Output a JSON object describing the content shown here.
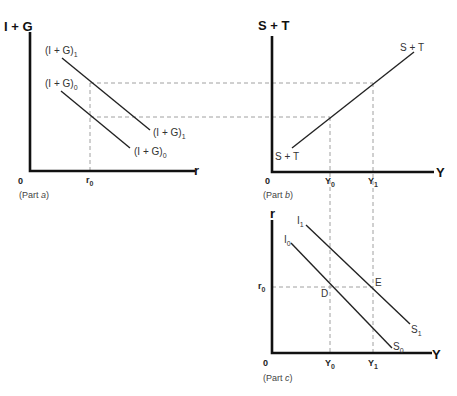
{
  "panels": {
    "a": {
      "y_axis_title": "I + G",
      "x_axis_title": "r",
      "origin": "0",
      "tick_r0": "r",
      "tick_r0_sub": "0",
      "caption_prefix": "(Part ",
      "caption_letter": "a",
      "caption_suffix": ")",
      "curve1_label_top": "(I + G)",
      "curve1_label_top_sub": "1",
      "curve1_label_bottom": "(I + G)",
      "curve1_label_bottom_sub": "1",
      "curve0_label_top": "(I + G)",
      "curve0_label_top_sub": "0",
      "curve0_label_bottom": "(I + G)",
      "curve0_label_bottom_sub": "0"
    },
    "b": {
      "y_axis_title": "S + T",
      "x_axis_title": "Y",
      "origin": "0",
      "tick_y0": "Y",
      "tick_y0_sub": "0",
      "tick_y1": "Y",
      "tick_y1_sub": "1",
      "caption_prefix": "(Part ",
      "caption_letter": "b",
      "caption_suffix": ")",
      "curve_label_top": "S + T",
      "curve_label_bottom": "S + T"
    },
    "c": {
      "y_axis_title": "r",
      "x_axis_title": "Y",
      "origin": "0",
      "tick_r0": "r",
      "tick_r0_sub": "0",
      "tick_y0": "Y",
      "tick_y0_sub": "0",
      "tick_y1": "Y",
      "tick_y1_sub": "1",
      "caption_prefix": "(Part ",
      "caption_letter": "c",
      "caption_suffix": ")",
      "curve1_label_top": "I",
      "curve1_label_top_sub": "1",
      "curve1_label_bottom": "S",
      "curve1_label_bottom_sub": "1",
      "curve0_label_top": "I",
      "curve0_label_top_sub": "0",
      "curve0_label_bottom": "S",
      "curve0_label_bottom_sub": "0",
      "point_d": "D",
      "point_e": "E"
    }
  }
}
